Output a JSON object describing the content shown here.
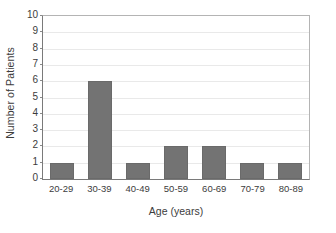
{
  "chart_data": {
    "type": "bar",
    "title": "",
    "subtitle": "",
    "categories": [
      "20-29",
      "30-39",
      "40-49",
      "50-59",
      "60-69",
      "70-79",
      "80-89"
    ],
    "values": [
      1,
      6,
      1,
      2,
      2,
      1,
      1
    ],
    "xlabel": "Age (years)",
    "ylabel": "Number of Patients",
    "ylim": [
      0,
      10
    ],
    "yticks": [
      0,
      1,
      2,
      3,
      4,
      5,
      6,
      7,
      8,
      9,
      10
    ],
    "ytick_labels": [
      "0",
      "1",
      "2",
      "3",
      "4",
      "5",
      "6",
      "7",
      "8",
      "9",
      "10"
    ],
    "grid": true,
    "grid_axis": "y",
    "legend": false,
    "legend_position": "none",
    "bar_color": "#737373",
    "bar_edge_color": "#6a6a6a",
    "grid_color": "#e9e9e9",
    "axis_color": "#7a7a7a",
    "frame_color": "#b4b4b4",
    "background_color": "#ffffff",
    "text_color": "#3c3c3c",
    "annotations": []
  }
}
